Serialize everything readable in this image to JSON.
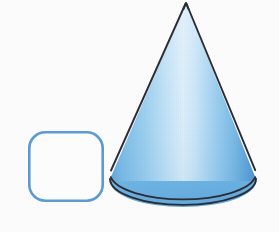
{
  "figure": {
    "background_color": "#fefefe",
    "width": 279,
    "height": 232,
    "shapes": [
      {
        "name": "rounded-square",
        "label": "Rounded square outline",
        "fill_color": "#ffffff",
        "stroke_color": "#5b9bd5",
        "stroke_width": 2.6,
        "x": 28,
        "y": 131,
        "width": 76,
        "height": 71,
        "corner_radius": 16
      },
      {
        "name": "cone",
        "label": "Blue three dimensional cone",
        "apex_x": 186,
        "apex_y": 3,
        "base_center_x": 183,
        "base_center_y": 181,
        "base_radius_x": 73,
        "base_radius_y": 26,
        "outline_color": "#2b2b33",
        "outline_width": 1.8,
        "base_fill_color": "#6cb4e4",
        "body_highlight_color": "#d7ecfa",
        "body_mid_color": "#8fc8ec",
        "body_edge_color": "#5ba5dc",
        "body_dark_color": "#4b93cf"
      }
    ]
  }
}
